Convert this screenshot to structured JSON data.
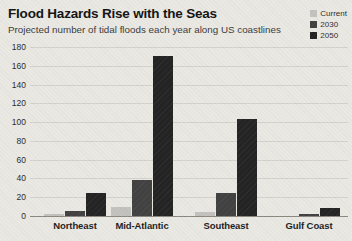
{
  "header": {
    "title": "Flood Hazards Rise with the Seas",
    "subtitle": "Projected number of tidal floods each year along US coastlines"
  },
  "legend": {
    "position": "top-right",
    "items": [
      {
        "label": "Current",
        "color": "#c3c2be"
      },
      {
        "label": "2030",
        "color": "#424242"
      },
      {
        "label": "2050",
        "color": "#242424"
      }
    ]
  },
  "chart_data": {
    "type": "bar",
    "title": "Flood Hazards Rise with the Seas",
    "subtitle": "Projected number of tidal floods each year along US coastlines",
    "categories": [
      "Northeast",
      "Mid-Atlantic",
      "Southeast",
      "Gulf Coast"
    ],
    "series": [
      {
        "name": "Current",
        "color": "#c3c2be",
        "values": [
          2,
          10,
          4,
          0
        ]
      },
      {
        "name": "2030",
        "color": "#424242",
        "values": [
          5,
          38,
          25,
          2
        ]
      },
      {
        "name": "2050",
        "color": "#242424",
        "values": [
          25,
          170,
          103,
          9
        ]
      }
    ],
    "xlabel": "",
    "ylabel": "",
    "ylim": [
      0,
      180
    ],
    "ytick_step": 20,
    "grid": true,
    "legend_position": "top-right"
  },
  "colors": {
    "background": "#eae8e3",
    "gridline": "#d4d2cc",
    "axis_line": "#8a887f",
    "tick_text": "#2c2c2c",
    "category_text": "#1e1e1e"
  }
}
